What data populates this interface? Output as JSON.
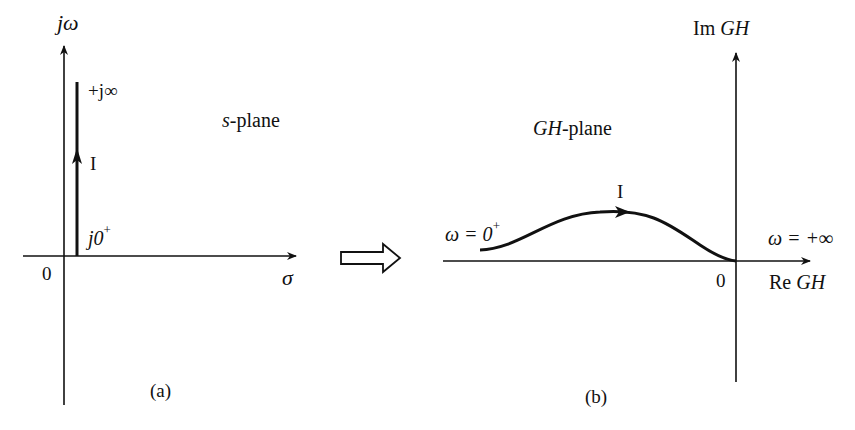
{
  "figure": {
    "panel_a": {
      "caption": "(a)",
      "plane_label": {
        "italic": "s",
        "rest": "-plane"
      },
      "vertical_axis_label": "jω",
      "horizontal_axis_label": "σ",
      "origin_label": "0",
      "path_top_label": "+j∞",
      "path_bottom_label": {
        "base": "j0",
        "sup": "+"
      },
      "path_direction_label": "I"
    },
    "transform_arrow": {
      "icon": "hollow-right-arrow"
    },
    "panel_b": {
      "caption": "(b)",
      "plane_label": {
        "italic": "GH",
        "rest": "-plane"
      },
      "vertical_axis_label": {
        "prefix": "Im ",
        "italic": "GH"
      },
      "horizontal_axis_label": {
        "prefix": "Re ",
        "italic": "GH"
      },
      "origin_label": "0",
      "start_label": {
        "base": "ω = 0",
        "sup": "+"
      },
      "end_label": "ω = +∞",
      "path_direction_label": "I"
    },
    "colors": {
      "ink": "#111111",
      "background": "#ffffff"
    }
  }
}
